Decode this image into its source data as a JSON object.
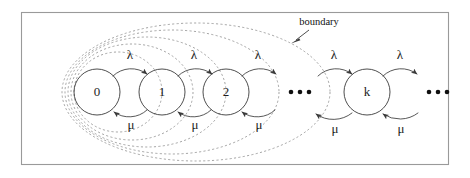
{
  "figure": {
    "kind": "markov-chain-state-transition-diagram",
    "title_text": "",
    "frame": {
      "x": 21,
      "y": 12,
      "width": 428,
      "height": 153,
      "stroke": "#9a9a9a"
    },
    "colors": {
      "state_stroke": "#2e2e2e",
      "arc_stroke": "#3a3a3a",
      "boundary_stroke": "#8e8e8e",
      "frame_stroke": "#9a9a9a",
      "text": "#1d1d1d",
      "background": "#ffffff"
    }
  },
  "states": [
    {
      "label": "0",
      "cx": 97,
      "cy": 92,
      "r": 23
    },
    {
      "label": "1",
      "cx": 162,
      "cy": 92,
      "r": 23
    },
    {
      "label": "2",
      "cx": 226,
      "cy": 92,
      "r": 23
    },
    {
      "label": "k",
      "cx": 367,
      "cy": 92,
      "r": 23
    }
  ],
  "ellipses_groups": [
    {
      "name": "ellipsis-middle",
      "cx": 300,
      "cy": 92,
      "dots": 3
    },
    {
      "name": "ellipsis-right",
      "cx": 438,
      "cy": 92,
      "dots": 3
    }
  ],
  "transitions": {
    "birth_label": "λ",
    "death_label": "μ",
    "birth_arcs": [
      {
        "from": "0",
        "to": "1",
        "label": "λ",
        "label_x": 130,
        "label_y": 56
      },
      {
        "from": "1",
        "to": "2",
        "label": "λ",
        "label_x": 194,
        "label_y": 56
      },
      {
        "from": "2",
        "to": "…",
        "label": "λ",
        "label_x": 258,
        "label_y": 56
      },
      {
        "from": "…",
        "to": "k",
        "label": "λ",
        "label_x": 334,
        "label_y": 56
      },
      {
        "from": "k",
        "to": "…",
        "label": "λ",
        "label_x": 400,
        "label_y": 56
      }
    ],
    "death_arcs": [
      {
        "from": "1",
        "to": "0",
        "label": "μ",
        "label_x": 131,
        "label_y": 125
      },
      {
        "from": "2",
        "to": "1",
        "label": "μ",
        "label_x": 195,
        "label_y": 125
      },
      {
        "from": "…",
        "to": "2",
        "label": "μ",
        "label_x": 259,
        "label_y": 125
      },
      {
        "from": "k",
        "to": "…",
        "label": "μ",
        "label_x": 335,
        "label_y": 128
      },
      {
        "from": "…",
        "to": "k",
        "label": "μ",
        "label_x": 401,
        "label_y": 128
      }
    ]
  },
  "annotations": {
    "boundary": {
      "text": "boundary",
      "label_x": 319,
      "label_y": 23,
      "leader_from_x": 307,
      "leader_from_y": 30,
      "leader_to_x": 293,
      "leader_to_y": 42
    }
  },
  "boundary_curves": [
    {
      "index": 1,
      "cx": 118,
      "cy": 92,
      "rx": 44,
      "ry": 40
    },
    {
      "index": 2,
      "cx": 132,
      "cy": 92,
      "rx": 61,
      "ry": 48
    },
    {
      "index": 3,
      "cx": 147,
      "cy": 92,
      "rx": 79,
      "ry": 55
    },
    {
      "index": 4,
      "cx": 172,
      "cy": 92,
      "rx": 107,
      "ry": 62
    },
    {
      "index": 5,
      "cx": 196,
      "cy": 92,
      "rx": 134,
      "ry": 69
    }
  ]
}
